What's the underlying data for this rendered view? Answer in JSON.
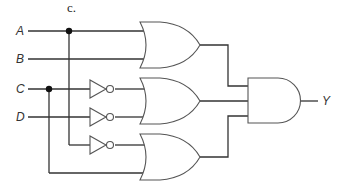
{
  "caption": "c.",
  "inputs": [
    {
      "name": "A",
      "y": 31
    },
    {
      "name": "B",
      "y": 59
    },
    {
      "name": "C",
      "y": 89
    },
    {
      "name": "D",
      "y": 117
    }
  ],
  "output": {
    "name": "Y"
  },
  "gates": [
    {
      "type": "OR",
      "inputs": [
        "A",
        "B"
      ]
    },
    {
      "type": "OR",
      "inputs": [
        "NOT C",
        "NOT D"
      ]
    },
    {
      "type": "OR",
      "inputs": [
        "NOT A",
        "C"
      ]
    },
    {
      "type": "AND",
      "inputs": [
        "OR1",
        "OR2",
        "OR3"
      ],
      "output": "Y"
    }
  ],
  "inverters": [
    "C",
    "D",
    "A"
  ]
}
